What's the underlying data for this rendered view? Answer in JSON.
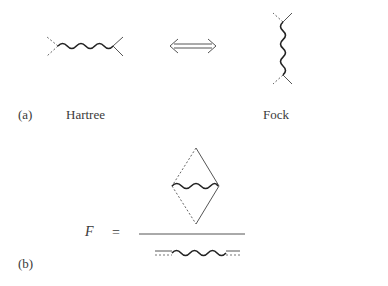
{
  "panel_a": {
    "label": "(a)",
    "hartree_label": "Hartree",
    "fock_label": "Fock",
    "equivalence_symbol": "double-arrow-icon"
  },
  "panel_b": {
    "label": "(b)",
    "lhs": "F",
    "equals": "="
  },
  "colors": {
    "line": "#555555",
    "wavy": "#222222",
    "text": "#3a3a3a"
  }
}
